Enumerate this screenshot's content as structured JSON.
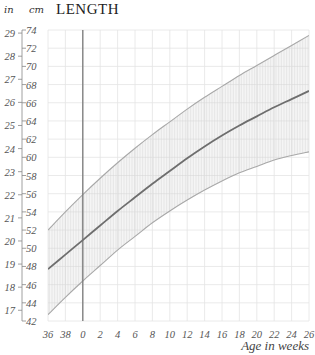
{
  "header": {
    "unit_in": "in",
    "unit_cm": "cm",
    "title": "LENGTH"
  },
  "chart_data": {
    "type": "line",
    "title": "LENGTH",
    "xlabel": "Age in weeks",
    "ylabel_left": "in",
    "ylabel_right": "cm",
    "x_tick_labels": [
      "36",
      "38",
      "0",
      "2",
      "4",
      "6",
      "8",
      "10",
      "12",
      "14",
      "16",
      "18",
      "20",
      "22",
      "24",
      "26"
    ],
    "x_note": "36 and 38 are gestational weeks before birth; vertical line at 0 marks birth",
    "cm_ticks": [
      42,
      44,
      46,
      48,
      50,
      52,
      54,
      56,
      58,
      60,
      62,
      64,
      66,
      68,
      70,
      72,
      74
    ],
    "in_ticks": [
      17,
      18,
      19,
      20,
      21,
      22,
      23,
      24,
      25,
      26,
      27,
      28,
      29
    ],
    "ylim_cm": [
      42,
      74
    ],
    "grid": true,
    "birth_marker_x": "0",
    "series": [
      {
        "name": "Upper band",
        "style": "thin gray",
        "values_cm": [
          52.0,
          54.0,
          55.9,
          57.7,
          59.4,
          61.0,
          62.5,
          63.9,
          65.3,
          66.6,
          67.8,
          69.0,
          70.1,
          71.2,
          72.3,
          73.4
        ]
      },
      {
        "name": "Median",
        "style": "dark solid",
        "values_cm": [
          47.7,
          49.3,
          50.9,
          52.5,
          54.1,
          55.6,
          57.1,
          58.5,
          59.9,
          61.2,
          62.4,
          63.5,
          64.5,
          65.5,
          66.4,
          67.3
        ]
      },
      {
        "name": "Lower band",
        "style": "thin gray",
        "values_cm": [
          42.7,
          44.6,
          46.4,
          48.1,
          49.8,
          51.3,
          52.8,
          54.1,
          55.3,
          56.4,
          57.4,
          58.3,
          59.0,
          59.7,
          60.2,
          60.6
        ]
      }
    ],
    "band_fill": "vertical hatching between upper and lower curves",
    "colors": {
      "median": "#6e6e6e",
      "band_edge": "#a8a8a8",
      "hatch": "#d4d4d4",
      "grid": "#e4e4e4",
      "birth_line": "#7a7a7a",
      "axis": "#888888"
    }
  }
}
